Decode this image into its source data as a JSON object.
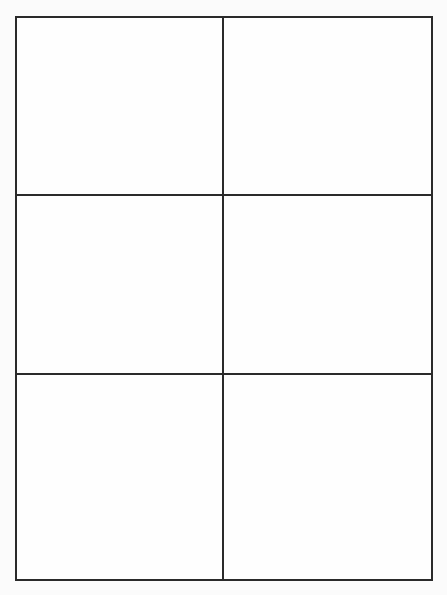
{
  "page": {
    "top_text_fragment": "",
    "background_color": "#fbfbfb",
    "line_color": "#2a2a2a"
  },
  "grid": {
    "rows": 3,
    "columns": 2,
    "cells": [
      {
        "row": 1,
        "col": 1,
        "content": ""
      },
      {
        "row": 1,
        "col": 2,
        "content": ""
      },
      {
        "row": 2,
        "col": 1,
        "content": ""
      },
      {
        "row": 2,
        "col": 2,
        "content": ""
      },
      {
        "row": 3,
        "col": 1,
        "content": ""
      },
      {
        "row": 3,
        "col": 2,
        "content": ""
      }
    ]
  }
}
